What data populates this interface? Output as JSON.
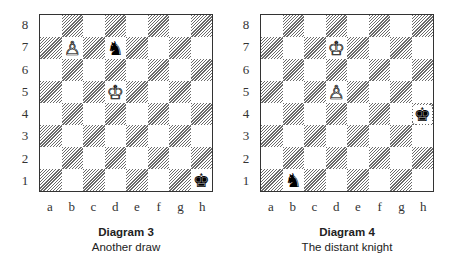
{
  "diagrams": [
    {
      "title": "Diagram 3",
      "subtitle": "Another draw",
      "ranks": [
        "8",
        "7",
        "6",
        "5",
        "4",
        "3",
        "2",
        "1"
      ],
      "files": [
        "a",
        "b",
        "c",
        "d",
        "e",
        "f",
        "g",
        "h"
      ],
      "pieces": [
        {
          "square": "b7",
          "type": "pawn",
          "color": "white",
          "glyph": "♙"
        },
        {
          "square": "d7",
          "type": "knight",
          "color": "black",
          "glyph": "♞"
        },
        {
          "square": "d5",
          "type": "king",
          "color": "white",
          "glyph": "♔"
        },
        {
          "square": "h1",
          "type": "king",
          "color": "black",
          "glyph": "♚"
        }
      ]
    },
    {
      "title": "Diagram 4",
      "subtitle": "The distant knight",
      "ranks": [
        "8",
        "7",
        "6",
        "5",
        "4",
        "3",
        "2",
        "1"
      ],
      "files": [
        "a",
        "b",
        "c",
        "d",
        "e",
        "f",
        "g",
        "h"
      ],
      "pieces": [
        {
          "square": "d7",
          "type": "king",
          "color": "white",
          "glyph": "♔"
        },
        {
          "square": "d5",
          "type": "pawn",
          "color": "white",
          "glyph": "♙"
        },
        {
          "square": "h4",
          "type": "king",
          "color": "black",
          "glyph": "♚"
        },
        {
          "square": "b1",
          "type": "knight",
          "color": "black",
          "glyph": "♞"
        }
      ]
    }
  ]
}
